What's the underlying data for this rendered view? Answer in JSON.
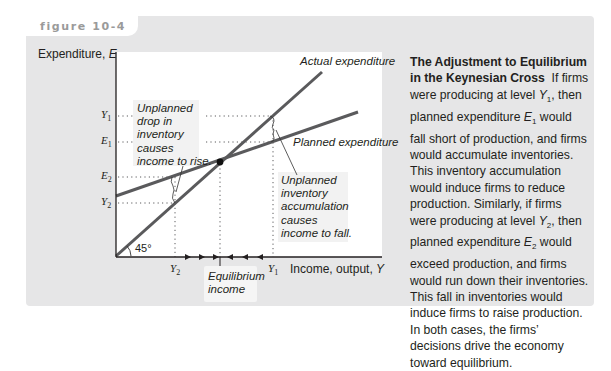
{
  "figure": {
    "label": "figure 10-4"
  },
  "axes": {
    "y_title": "Expenditure,",
    "y_symbol": "E",
    "x_title": "Income, output,",
    "x_symbol": "Y",
    "angle_label": "45°"
  },
  "y_ticks": [
    {
      "letter": "Y",
      "sub": "1"
    },
    {
      "letter": "E",
      "sub": "1"
    },
    {
      "letter": "E",
      "sub": "2"
    },
    {
      "letter": "Y",
      "sub": "2"
    }
  ],
  "x_ticks": [
    {
      "letter": "Y",
      "sub": "2"
    },
    {
      "letter": "Y",
      "sub": "1"
    }
  ],
  "curves": {
    "actual": "Actual expenditure",
    "planned": "Planned expenditure"
  },
  "notes": {
    "left": [
      "Unplanned",
      "drop in",
      "inventory",
      "causes",
      "income to rise."
    ],
    "right": [
      "Unplanned",
      "inventory",
      "accumulation",
      "causes",
      "income to fall."
    ],
    "equilibrium": [
      "Equilibrium",
      "income"
    ]
  },
  "caption": {
    "title": "The Adjustment to Equilibrium in the Keynesian Cross",
    "p1": "If firms were producing at level ",
    "p1_sym": "Y",
    "p1_sub": "1",
    "p2": ", then planned expenditure ",
    "p2_sym": "E",
    "p2_sub": "1",
    "p3": " would fall short of production, and firms would accumulate inventories. This inventory accumulation would induce firms to reduce production. Similarly, if firms were producing at level ",
    "p3_sym": "Y",
    "p3_sub": "2",
    "p4": ", then planned expenditure ",
    "p4_sym": "E",
    "p4_sub": "2",
    "p5": " would exceed production, and firms would run down their inventories. This fall in inventories would induce firms to raise production. In both cases, the firms’ decisions drive the economy toward equilibrium."
  },
  "colors": {
    "panel": "#e6e6e7",
    "line": "#5a5a5c",
    "text": "#231f20",
    "label_grey": "#9a9a9a"
  }
}
